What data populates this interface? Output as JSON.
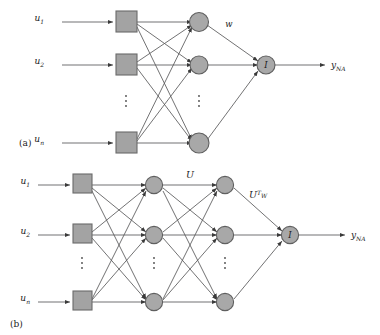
{
  "figure": {
    "background_color": "#ffffff",
    "node_fill": "#a8a8a8",
    "node_stroke": "#5f5f5f",
    "edge_color": "#58585a"
  },
  "panels": [
    {
      "id": "a",
      "caption": "(a)",
      "inputs": [
        {
          "base": "u",
          "sub": "1"
        },
        {
          "base": "u",
          "sub": "2"
        },
        {
          "base": "u",
          "sub": "n"
        }
      ],
      "ellipsis": "⋮",
      "weight_label": "w",
      "output_node_label": "I",
      "output": {
        "base": "y",
        "sub": "NA"
      },
      "layer_counts": {
        "input_squares": 3,
        "hidden_circles": 3,
        "output": 1
      }
    },
    {
      "id": "b",
      "caption": "(b)",
      "inputs": [
        {
          "base": "u",
          "sub": "1"
        },
        {
          "base": "u",
          "sub": "2"
        },
        {
          "base": "u",
          "sub": "n"
        }
      ],
      "ellipsis": "⋮",
      "weight_label_1": "U",
      "weight_label_2": {
        "base": "U",
        "sup": "T",
        "sub": "W"
      },
      "output_node_label": "I",
      "output": {
        "base": "y",
        "sub": "NA"
      },
      "layer_counts": {
        "input_squares": 3,
        "hidden1_circles": 3,
        "hidden2_circles": 3,
        "output": 1
      }
    }
  ]
}
